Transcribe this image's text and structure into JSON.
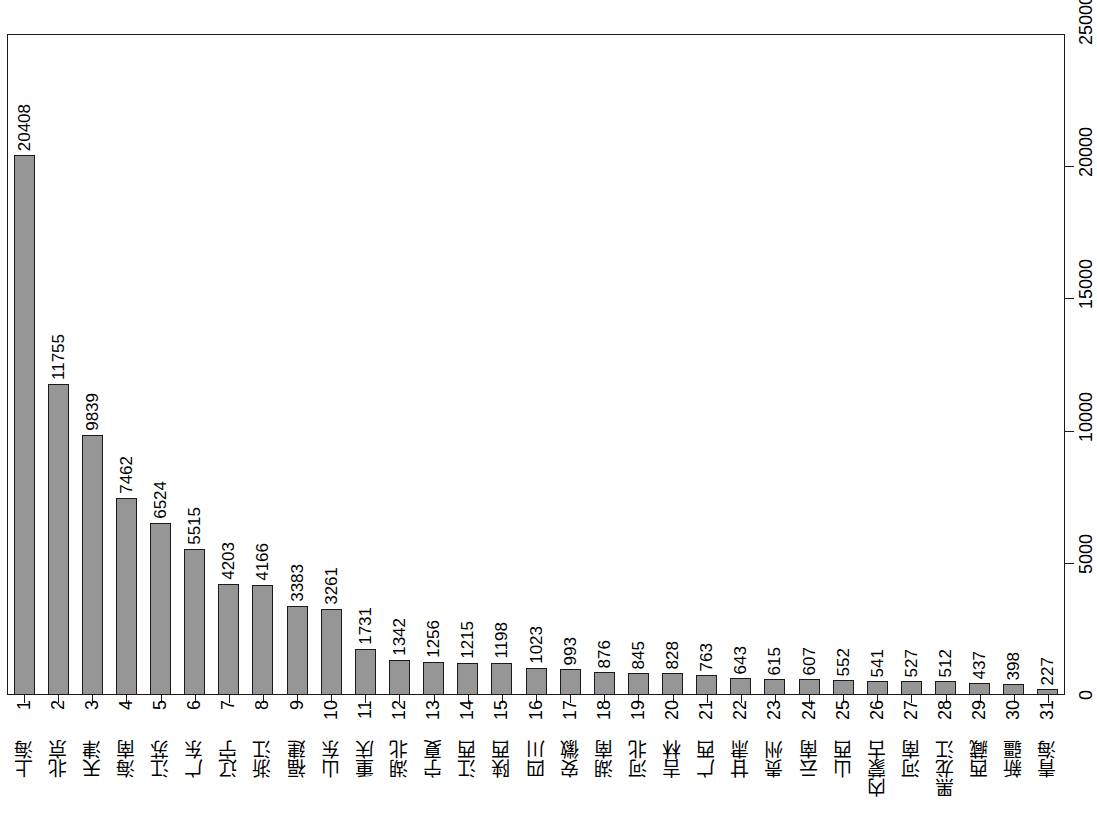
{
  "chart_data": {
    "type": "bar",
    "title": "",
    "subtitle": "",
    "xlabel": "",
    "ylabel": "",
    "ylim": [
      0,
      25000
    ],
    "yticks": [
      0,
      5000,
      10000,
      15000,
      20000,
      25000
    ],
    "ytick_labels": [
      "0",
      "5000",
      "10000",
      "15000",
      "20000",
      "25000"
    ],
    "grid": false,
    "legend": null,
    "orientation": "vertical-bars-rotated-labels",
    "bar_fill_color": "#969696",
    "bar_border_color": "#1a1a1a",
    "index_labels": [
      "1",
      "2",
      "3",
      "4",
      "5",
      "6",
      "7",
      "8",
      "9",
      "10",
      "11",
      "12",
      "13",
      "14",
      "15",
      "16",
      "17",
      "18",
      "19",
      "20",
      "21",
      "22",
      "23",
      "24",
      "25",
      "26",
      "27",
      "28",
      "29",
      "30",
      "31"
    ],
    "categories": [
      "上海",
      "北京",
      "天津",
      "海南",
      "江苏",
      "广东",
      "辽宁",
      "浙江",
      "福建",
      "山东",
      "重庆",
      "湖北",
      "宁夏",
      "江西",
      "陕西",
      "四川",
      "安徽",
      "湖南",
      "河北",
      "吉林",
      "广西",
      "甘肃",
      "贵州",
      "云南",
      "山西",
      "内蒙古",
      "河南",
      "黑龙江",
      "西藏",
      "新疆",
      "青海"
    ],
    "values": [
      20408,
      11755,
      9839,
      7462,
      6524,
      5515,
      4203,
      4166,
      3383,
      3261,
      1731,
      1342,
      1256,
      1215,
      1198,
      1023,
      993,
      876,
      845,
      828,
      763,
      643,
      615,
      607,
      552,
      541,
      527,
      512,
      437,
      398,
      227
    ],
    "data_labels": [
      "20408",
      "11755",
      "9839",
      "7462",
      "6524",
      "5515",
      "4203",
      "4166",
      "3383",
      "3261",
      "1731",
      "1342",
      "1256",
      "1215",
      "1198",
      "1023",
      "993",
      "876",
      "845",
      "828",
      "763",
      "643",
      "615",
      "607",
      "552",
      "541",
      "527",
      "512",
      "437",
      "398",
      "227"
    ]
  }
}
